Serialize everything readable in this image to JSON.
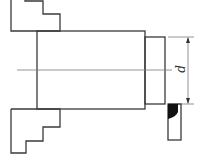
{
  "diagram": {
    "type": "lathe chuck turning diagram",
    "dimension_label": "d",
    "colors": {
      "line": "#3a3a3a",
      "insert": "#111111",
      "background": "#ffffff"
    }
  }
}
